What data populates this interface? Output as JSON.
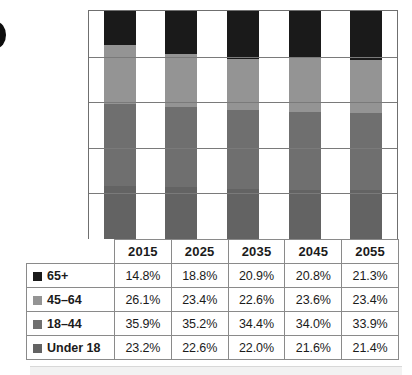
{
  "decoration": {
    "edge_dot": "bullet-dot",
    "caption_strip": "caption-box-top-edge"
  },
  "colors": {
    "65plus": "#1a1a1a",
    "45to64": "#949494",
    "18to44": "#6f6f6f",
    "under18": "#636363",
    "gridline": "#7a7a7a",
    "table_border": "#8a8a8a",
    "text": "#1b1b1b"
  },
  "table": {
    "corner_label": "",
    "year_headers": [
      "2015",
      "2025",
      "2035",
      "2045",
      "2055"
    ],
    "rows": [
      {
        "label": "65+",
        "swatch": "#1a1a1a",
        "values": [
          "14.8%",
          "18.8%",
          "20.9%",
          "20.8%",
          "21.3%"
        ]
      },
      {
        "label": "45–64",
        "swatch": "#949494",
        "values": [
          "26.1%",
          "23.4%",
          "22.6%",
          "23.6%",
          "23.4%"
        ]
      },
      {
        "label": "18–44",
        "swatch": "#6f6f6f",
        "values": [
          "35.9%",
          "35.2%",
          "34.4%",
          "34.0%",
          "33.9%"
        ]
      },
      {
        "label": "Under 18",
        "swatch": "#636363",
        "values": [
          "23.2%",
          "22.6%",
          "22.0%",
          "21.6%",
          "21.4%"
        ]
      }
    ]
  },
  "chart_data": {
    "type": "bar",
    "subtype": "stacked-column",
    "title": "",
    "xlabel": "",
    "ylabel": "",
    "ylim": [
      0,
      100
    ],
    "grid": true,
    "gridline_values": [
      20,
      40,
      60,
      80
    ],
    "legend_position": "in-table-row-labels",
    "categories": [
      "2015",
      "2025",
      "2035",
      "2045",
      "2055"
    ],
    "stack_order_bottom_to_top": [
      "Under 18",
      "18–44",
      "45–64",
      "65+"
    ],
    "series": [
      {
        "name": "65+",
        "color": "#1a1a1a",
        "values": [
          14.8,
          18.8,
          20.9,
          20.8,
          21.3
        ]
      },
      {
        "name": "45–64",
        "color": "#949494",
        "values": [
          26.1,
          23.4,
          22.6,
          23.6,
          23.4
        ]
      },
      {
        "name": "18–44",
        "color": "#6f6f6f",
        "values": [
          35.9,
          35.2,
          34.4,
          34.0,
          33.9
        ]
      },
      {
        "name": "Under 18",
        "color": "#636363",
        "values": [
          23.2,
          22.6,
          22.0,
          21.6,
          21.4
        ]
      }
    ]
  }
}
